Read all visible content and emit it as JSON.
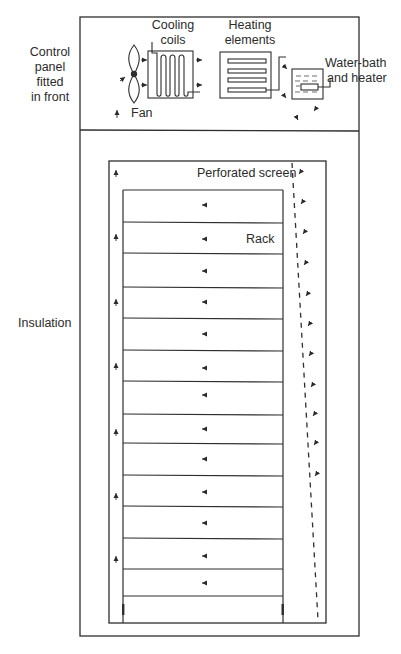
{
  "diagram": {
    "type": "schematic",
    "labels": {
      "control_panel": [
        "Control",
        "panel",
        "fitted",
        "in front"
      ],
      "cooling_coils": [
        "Cooling",
        "coils"
      ],
      "heating_elements": [
        "Heating",
        "elements"
      ],
      "water_bath": [
        "Water-bath",
        "and heater"
      ],
      "fan": "Fan",
      "perforated_screen": "Perforated screen",
      "rack": "Rack",
      "insulation": "Insulation"
    },
    "components": [
      {
        "id": "fan",
        "label": "Fan"
      },
      {
        "id": "cooling-coils",
        "label": "Cooling coils"
      },
      {
        "id": "heating-elements",
        "label": "Heating elements",
        "element_count": 4
      },
      {
        "id": "water-bath",
        "label": "Water-bath and heater"
      },
      {
        "id": "perforated-screen",
        "label": "Perforated screen",
        "style": "dashed"
      },
      {
        "id": "rack",
        "label": "Rack",
        "shelf_count": 14
      }
    ],
    "airflow": {
      "top_panel": "left to right through fan, cooling coils, heating elements, water-bath, then downward",
      "right_channel": "downward behind perforated screen",
      "rack": "right to left across shelves",
      "left_channel": "upward back to fan"
    },
    "caption_cut_off": true
  }
}
